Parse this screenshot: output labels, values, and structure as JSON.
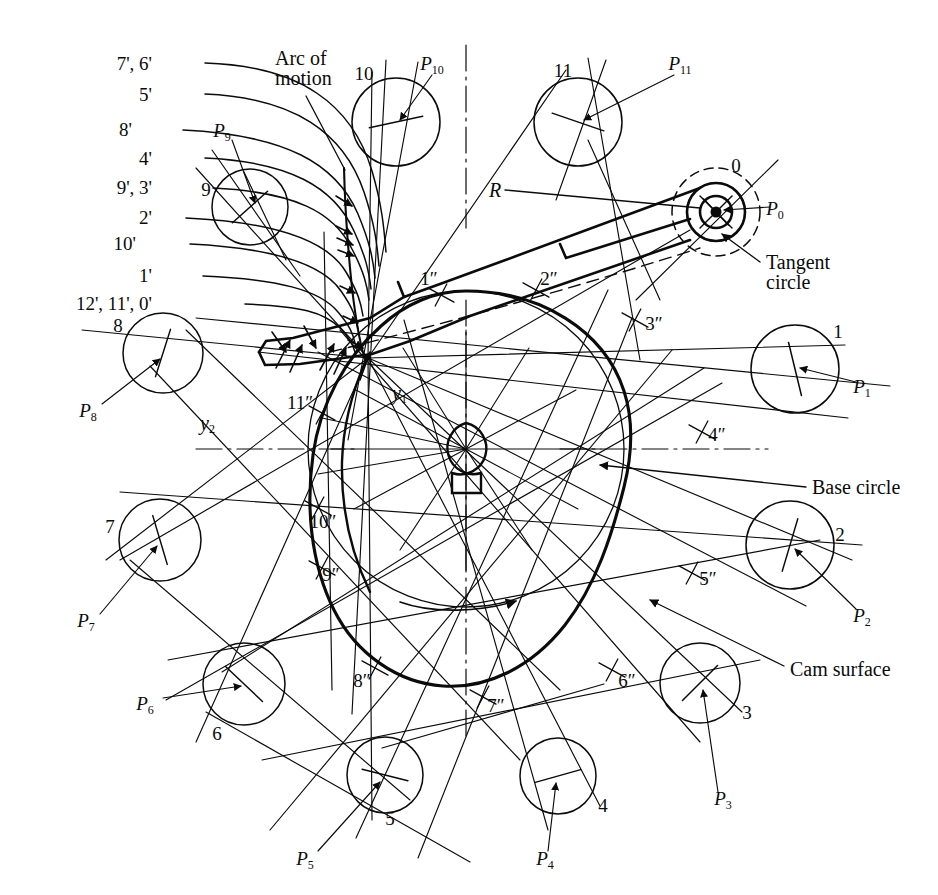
{
  "figure": {
    "background": "#ffffff",
    "ink": "#0b0b0b",
    "width": 938,
    "height": 895
  },
  "annotations": {
    "arc_of_motion_line1": "Arc of",
    "arc_of_motion_line2": "motion",
    "tangent_circle_line1": "Tangent",
    "tangent_circle_line2": "circle",
    "base_circle": "Base  circle",
    "cam_surface": "Cam  surface",
    "radius": "R",
    "y1": "y",
    "y1_sub": "1",
    "y2": "y",
    "y2_sub": "2"
  },
  "prime_labels": [
    {
      "text": "7', 6'",
      "x": 152,
      "y": 63
    },
    {
      "text": "5'",
      "x": 152,
      "y": 94
    },
    {
      "text": "8'",
      "x": 132,
      "y": 129
    },
    {
      "text": "4'",
      "x": 152,
      "y": 158
    },
    {
      "text": "9', 3'",
      "x": 152,
      "y": 187
    },
    {
      "text": "2'",
      "x": 152,
      "y": 217
    },
    {
      "text": "10'",
      "x": 136,
      "y": 243
    },
    {
      "text": "1'",
      "x": 152,
      "y": 275
    },
    {
      "text": "12', 11', 0'",
      "x": 152,
      "y": 303
    }
  ],
  "roller_circles": [
    {
      "id": "0",
      "number": "0",
      "cx": 716,
      "cy": 212,
      "r": 29,
      "num_x": 736,
      "num_y": 165,
      "p_label": "P",
      "p_sub": "0",
      "p_x": 775,
      "p_y": 210,
      "lead_x1": 770,
      "lead_y1": 207,
      "lead_x2": 724,
      "lead_y2": 210
    },
    {
      "id": "1",
      "number": "1",
      "cx": 795,
      "cy": 369,
      "r": 44,
      "num_x": 838,
      "num_y": 331,
      "p_label": "P",
      "p_sub": "1",
      "p_x": 862,
      "p_y": 388,
      "lead_x1": 856,
      "lead_y1": 382,
      "lead_x2": 800,
      "lead_y2": 368
    },
    {
      "id": "2",
      "number": "2",
      "cx": 790,
      "cy": 545,
      "r": 44,
      "num_x": 840,
      "num_y": 534,
      "p_label": "P",
      "p_sub": "2",
      "p_x": 862,
      "p_y": 617,
      "lead_x1": 856,
      "lead_y1": 609,
      "lead_x2": 795,
      "lead_y2": 549
    },
    {
      "id": "3",
      "number": "3",
      "cx": 700,
      "cy": 683,
      "r": 40,
      "num_x": 747,
      "num_y": 712,
      "p_label": "P",
      "p_sub": "3",
      "p_x": 723,
      "p_y": 800,
      "lead_x1": 718,
      "lead_y1": 792,
      "lead_x2": 703,
      "lead_y2": 690
    },
    {
      "id": "4",
      "number": "4",
      "cx": 558,
      "cy": 776,
      "r": 38,
      "num_x": 603,
      "num_y": 805,
      "p_label": "P",
      "p_sub": "4",
      "p_x": 545,
      "p_y": 860,
      "lead_x1": 548,
      "lead_y1": 851,
      "lead_x2": 556,
      "lead_y2": 783
    },
    {
      "id": "5",
      "number": "5",
      "cx": 385,
      "cy": 775,
      "r": 38,
      "num_x": 390,
      "num_y": 818,
      "p_label": "P",
      "p_sub": "5",
      "p_x": 305,
      "p_y": 860,
      "lead_x1": 318,
      "lead_y1": 851,
      "lead_x2": 380,
      "lead_y2": 782
    },
    {
      "id": "6",
      "number": "6",
      "cx": 244,
      "cy": 684,
      "r": 41,
      "num_x": 217,
      "num_y": 733,
      "p_label": "P",
      "p_sub": "6",
      "p_x": 145,
      "p_y": 705,
      "lead_x1": 163,
      "lead_y1": 698,
      "lead_x2": 241,
      "lead_y2": 686
    },
    {
      "id": "7",
      "number": "7",
      "cx": 160,
      "cy": 540,
      "r": 41,
      "num_x": 110,
      "num_y": 526,
      "p_label": "P",
      "p_sub": "7",
      "p_x": 86,
      "p_y": 622,
      "lead_x1": 100,
      "lead_y1": 614,
      "lead_x2": 157,
      "lead_y2": 546
    },
    {
      "id": "8",
      "number": "8",
      "cx": 163,
      "cy": 353,
      "r": 40,
      "num_x": 118,
      "num_y": 325,
      "p_label": "P",
      "p_sub": "8",
      "p_x": 88,
      "p_y": 412,
      "lead_x1": 102,
      "lead_y1": 404,
      "lead_x2": 160,
      "lead_y2": 359
    },
    {
      "id": "9",
      "number": "9",
      "cx": 250,
      "cy": 207,
      "r": 38,
      "num_x": 206,
      "num_y": 189,
      "p_label": "P",
      "p_sub": "9",
      "p_x": 222,
      "p_y": 132,
      "lead_x1": 232,
      "lead_y1": 140,
      "lead_x2": 255,
      "lead_y2": 203
    },
    {
      "id": "10",
      "number": "10",
      "cx": 396,
      "cy": 122,
      "r": 44,
      "num_x": 364,
      "num_y": 73,
      "p_label": "P",
      "p_sub": "10",
      "p_x": 432,
      "p_y": 65,
      "lead_x1": 432,
      "lead_y1": 75,
      "lead_x2": 400,
      "lead_y2": 120
    },
    {
      "id": "11",
      "number": "11",
      "cx": 578,
      "cy": 122,
      "r": 44,
      "num_x": 563,
      "num_y": 70,
      "p_label": "P",
      "p_sub": "11",
      "p_x": 680,
      "p_y": 65,
      "lead_x1": 674,
      "lead_y1": 75,
      "lead_x2": 584,
      "lead_y2": 120
    }
  ],
  "double_prime_marks": [
    {
      "text": "1\"",
      "x": 429,
      "y": 278,
      "mx": 441,
      "my": 295
    },
    {
      "text": "2\"",
      "x": 549,
      "y": 278,
      "mx": 536,
      "my": 290
    },
    {
      "text": "3\"",
      "x": 654,
      "y": 323,
      "mx": 635,
      "my": 320
    },
    {
      "text": "4\"",
      "x": 717,
      "y": 434,
      "mx": 702,
      "my": 432
    },
    {
      "text": "5\"",
      "x": 708,
      "y": 578,
      "mx": 692,
      "my": 573
    },
    {
      "text": "6\"",
      "x": 627,
      "y": 680,
      "mx": 612,
      "my": 670
    },
    {
      "text": "7\"",
      "x": 496,
      "y": 705,
      "mx": 483,
      "my": 697
    },
    {
      "text": "8\"",
      "x": 362,
      "y": 680,
      "mx": 375,
      "my": 668
    },
    {
      "text": "9\"",
      "x": 331,
      "y": 574,
      "mx": 322,
      "my": 568
    },
    {
      "text": "10\"",
      "x": 323,
      "y": 521,
      "mx": 318,
      "my": 508
    },
    {
      "text": "11\"",
      "x": 300,
      "y": 402,
      "mx": 322,
      "my": 413
    }
  ],
  "leaders": {
    "arc_of_motion": {
      "label_x": 275,
      "label_y": 58,
      "x1": 306,
      "y1": 96,
      "x2": 345,
      "y2": 170
    },
    "tangent_circle": {
      "label_x": 766,
      "label_y": 263,
      "x1": 760,
      "y1": 262,
      "x2": 722,
      "y2": 234
    },
    "base_circle": {
      "label_x": 812,
      "label_y": 487,
      "x1": 806,
      "y1": 487,
      "x2": 600,
      "y2": 465
    },
    "cam_surface": {
      "label_x": 790,
      "label_y": 669,
      "x1": 784,
      "y1": 666,
      "x2": 650,
      "y2": 600
    },
    "radius": {
      "label_x": 489,
      "label_y": 190,
      "x1": 505,
      "y1": 190,
      "x2": 700,
      "y2": 208
    }
  },
  "geometry": {
    "cam_center": {
      "x": 466,
      "y": 449
    },
    "hub_radius": 26,
    "base_circle_radius": 113,
    "cam_mean_radius": 158,
    "pivot": {
      "x": 716,
      "y": 212
    },
    "pivot_inner_radius": 11,
    "pivot_mid_radius": 22,
    "tangent_circle_radius": 44,
    "rotation_arrow": "clockwise"
  }
}
